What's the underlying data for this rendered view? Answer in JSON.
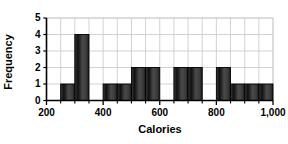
{
  "chart_data": {
    "type": "bar",
    "title": "",
    "subtitle": "",
    "xlabel": "Calories",
    "ylabel": "Frequency",
    "xlim": [
      200,
      1000
    ],
    "ylim": [
      0,
      5
    ],
    "bin_width": 50,
    "grid": true,
    "legend": null,
    "x_tick_labels": [
      "200",
      "400",
      "600",
      "800",
      "1,000"
    ],
    "x_tick_values": [
      200,
      400,
      600,
      800,
      1000
    ],
    "x_minor_tick_values": [
      250,
      300,
      350,
      450,
      500,
      550,
      650,
      700,
      750,
      850,
      900,
      950
    ],
    "y_tick_labels": [
      "0",
      "1",
      "2",
      "3",
      "4",
      "5"
    ],
    "y_tick_values": [
      0,
      1,
      2,
      3,
      4,
      5
    ],
    "categories": [
      "200-250",
      "250-300",
      "300-350",
      "350-400",
      "400-450",
      "450-500",
      "500-550",
      "550-600",
      "600-650",
      "650-700",
      "700-750",
      "750-800",
      "800-850",
      "850-900",
      "900-950",
      "950-1000"
    ],
    "bin_starts": [
      200,
      250,
      300,
      350,
      400,
      450,
      500,
      550,
      600,
      650,
      700,
      750,
      800,
      850,
      900,
      950
    ],
    "values": [
      0,
      1,
      4,
      0,
      1,
      1,
      2,
      2,
      0,
      2,
      2,
      0,
      2,
      1,
      1,
      1
    ],
    "annotations": []
  },
  "style": {
    "bar_color": "#2b2b2b",
    "bar_edge_color": "#000000",
    "grid_color": "#c8c8c8",
    "axis_color": "#000000",
    "background": "#ffffff",
    "text_color": "#000000"
  },
  "accessibility": {
    "chart_name": "calories-frequency-histogram"
  }
}
